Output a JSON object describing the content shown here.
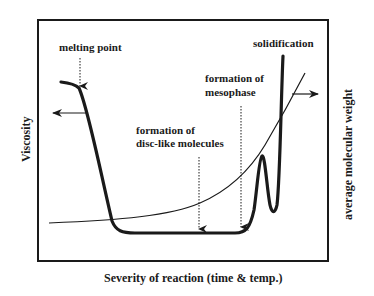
{
  "diagram": {
    "x_axis_label": "Severity of reaction (time & temp.)",
    "y_axis_left_label": "Viscosity",
    "y_axis_right_label": "average molecular weight",
    "annotations": {
      "melting_point": "melting point",
      "solidification": "solidification",
      "mesophase_line1": "formation of",
      "mesophase_line2": "mesophase",
      "disc_line1": "formation of",
      "disc_line2": "disc-like molecules"
    },
    "curves": [
      {
        "name": "viscosity",
        "style": "thick",
        "axis": "left"
      },
      {
        "name": "average molecular weight",
        "style": "thin",
        "axis": "right"
      }
    ],
    "colors": {
      "ink": "#1a1a1a",
      "background": "#ffffff"
    }
  }
}
